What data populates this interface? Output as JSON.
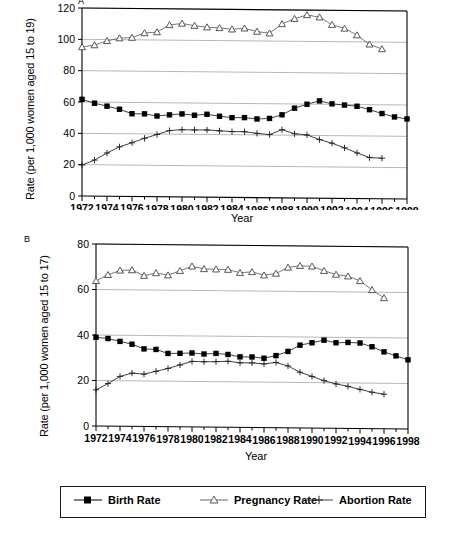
{
  "figure": {
    "panels": [
      {
        "letter": "A",
        "ylabel": "Rate (per 1,000 women aged 15 to 19)",
        "xlabel": "Year"
      },
      {
        "letter": "B",
        "ylabel": "Rate (per 1,000 women aged 15 to 17)",
        "xlabel": "Year"
      }
    ]
  },
  "legend": {
    "items": [
      {
        "label": "Birth Rate",
        "marker": "filled-square-marker",
        "color": "#000000"
      },
      {
        "label": "Pregnancy Rate",
        "marker": "open-triangle-marker",
        "color": "#555555"
      },
      {
        "label": "Abortion Rate",
        "marker": "plus-marker",
        "color": "#333333"
      }
    ]
  },
  "chart_data": [
    {
      "type": "line",
      "panel": "A",
      "title": "",
      "xlabel": "Year",
      "ylabel": "Rate (per 1,000 women aged 15 to 19)",
      "x": [
        1972,
        1973,
        1974,
        1975,
        1976,
        1977,
        1978,
        1979,
        1980,
        1981,
        1982,
        1983,
        1984,
        1985,
        1986,
        1987,
        1988,
        1989,
        1990,
        1991,
        1992,
        1993,
        1994,
        1995,
        1996,
        1997,
        1998
      ],
      "xlim": [
        1972,
        1998
      ],
      "ylim": [
        0,
        120
      ],
      "yticks": [
        0,
        20,
        40,
        60,
        80,
        100,
        120
      ],
      "xticks": [
        1972,
        1974,
        1976,
        1978,
        1980,
        1982,
        1984,
        1986,
        1988,
        1990,
        1992,
        1994,
        1996,
        1998
      ],
      "grid": true,
      "legend_position": "below-figure",
      "series": [
        {
          "name": "Birth Rate",
          "marker": "filled-square",
          "values": [
            61.7,
            59.3,
            57.5,
            55.6,
            52.8,
            52.8,
            51.5,
            52.3,
            53.0,
            52.2,
            52.9,
            51.7,
            50.9,
            51.0,
            50.2,
            50.6,
            53.0,
            57.3,
            59.9,
            62.1,
            60.3,
            59.6,
            58.9,
            56.8,
            54.4,
            52.3,
            51.1
          ]
        },
        {
          "name": "Pregnancy Rate",
          "marker": "open-triangle",
          "values": [
            95.1,
            96.4,
            99.2,
            101.0,
            101.4,
            104.4,
            105.1,
            109.7,
            110.7,
            109.4,
            108.5,
            108.1,
            107.3,
            108.0,
            106.0,
            105.0,
            111.0,
            114.4,
            116.9,
            115.5,
            110.8,
            108.5,
            104.3,
            98.5,
            95.6,
            null,
            null
          ]
        },
        {
          "name": "Abortion Rate",
          "marker": "plus",
          "values": [
            19.8,
            23.0,
            27.6,
            31.6,
            34.3,
            37.2,
            39.7,
            42.3,
            42.9,
            42.8,
            42.9,
            42.4,
            42.0,
            42.0,
            41.0,
            40.3,
            43.5,
            41.0,
            40.3,
            37.4,
            35.2,
            32.3,
            29.1,
            26.2,
            25.9,
            null,
            null
          ]
        }
      ],
      "notes": "Values read from axis; pregnancy and abortion series end at 1996, birth rate continues to 1998."
    },
    {
      "type": "line",
      "panel": "B",
      "title": "",
      "xlabel": "Year",
      "ylabel": "Rate (per 1,000 women aged 15 to 17)",
      "x": [
        1972,
        1973,
        1974,
        1975,
        1976,
        1977,
        1978,
        1979,
        1980,
        1981,
        1982,
        1983,
        1984,
        1985,
        1986,
        1987,
        1988,
        1989,
        1990,
        1991,
        1992,
        1993,
        1994,
        1995,
        1996,
        1997,
        1998
      ],
      "xlim": [
        1972,
        1998
      ],
      "ylim": [
        0,
        80
      ],
      "yticks": [
        0,
        20,
        40,
        60,
        80
      ],
      "xticks": [
        1972,
        1974,
        1976,
        1978,
        1980,
        1982,
        1984,
        1986,
        1988,
        1990,
        1992,
        1994,
        1996,
        1998
      ],
      "grid": true,
      "legend_position": "below-figure",
      "series": [
        {
          "name": "Birth Rate",
          "marker": "filled-square",
          "values": [
            39.0,
            38.5,
            37.3,
            36.1,
            34.1,
            33.9,
            32.2,
            32.3,
            32.5,
            32.1,
            32.4,
            32.0,
            31.0,
            31.0,
            30.5,
            31.7,
            33.6,
            36.4,
            37.5,
            38.7,
            37.6,
            37.8,
            37.6,
            36.0,
            33.8,
            32.1,
            30.4
          ]
        },
        {
          "name": "Pregnancy Rate",
          "marker": "open-triangle",
          "values": [
            63.8,
            66.5,
            68.5,
            68.7,
            66.3,
            67.5,
            66.6,
            68.6,
            70.6,
            69.5,
            69.4,
            69.3,
            68.0,
            68.4,
            67.0,
            67.8,
            70.5,
            71.3,
            71.1,
            69.2,
            67.6,
            66.9,
            64.9,
            61.0,
            57.5,
            null,
            null
          ]
        },
        {
          "name": "Abortion Rate",
          "marker": "plus",
          "values": [
            15.9,
            18.7,
            21.9,
            23.4,
            23.0,
            24.3,
            25.6,
            27.2,
            28.8,
            28.7,
            28.8,
            29.0,
            28.4,
            28.4,
            28.0,
            28.7,
            27.2,
            24.5,
            22.7,
            20.9,
            19.5,
            18.5,
            17.2,
            16.0,
            15.2,
            null,
            null
          ]
        }
      ],
      "notes": "Values read from axis; pregnancy and abortion series end at 1996, birth rate continues to 1998."
    }
  ]
}
